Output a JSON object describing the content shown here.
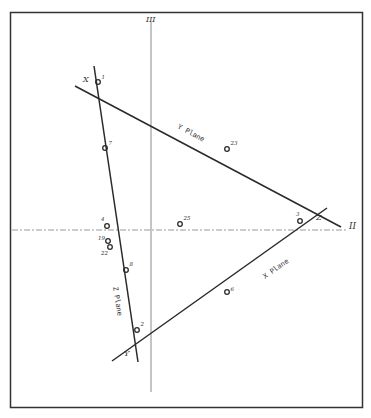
{
  "axes": {
    "vertical_label": "III",
    "horizontal_label": "II"
  },
  "vertices": {
    "x": "X",
    "y": "Y",
    "z": "Z"
  },
  "planes": {
    "x_plane": "X Plane",
    "y_plane": "Y Plane",
    "z_plane": "Z Plane"
  },
  "points": [
    {
      "label": "1",
      "x": 98,
      "y": 82
    },
    {
      "label": "7",
      "x": 105,
      "y": 148
    },
    {
      "label": "23",
      "x": 227,
      "y": 149
    },
    {
      "label": "4",
      "x": 107,
      "y": 226
    },
    {
      "label": "25",
      "x": 180,
      "y": 224
    },
    {
      "label": "3",
      "x": 300,
      "y": 221
    },
    {
      "label": "19",
      "x": 108,
      "y": 241
    },
    {
      "label": "22",
      "x": 110,
      "y": 247
    },
    {
      "label": "8",
      "x": 126,
      "y": 270
    },
    {
      "label": "6",
      "x": 227,
      "y": 292
    },
    {
      "label": "2",
      "x": 137,
      "y": 330
    }
  ],
  "colors": {
    "ink": "#2a2a2a",
    "axis": "#8a8a8a",
    "frame": "#333333",
    "background": "#ffffff"
  }
}
